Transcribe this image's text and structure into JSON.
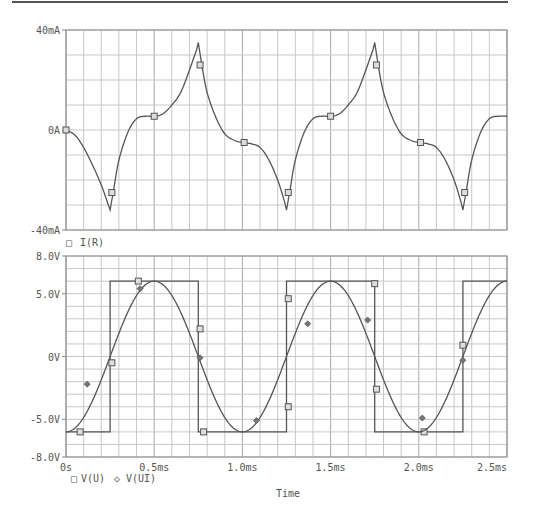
{
  "chart_data": [
    {
      "type": "line",
      "title": "",
      "xlabel": "",
      "ylabel": "",
      "xlim": [
        0,
        2.5
      ],
      "ylim": [
        -40,
        40
      ],
      "y_unit": "mA",
      "y_ticks": [
        {
          "value": 40,
          "label": "40mA"
        },
        {
          "value": 0,
          "label": "0A"
        },
        {
          "value": -40,
          "label": "-40mA"
        }
      ],
      "grid": true,
      "legend": [
        {
          "marker": "square",
          "label": "I(R)"
        }
      ],
      "series": [
        {
          "name": "I(R)",
          "marker": "square",
          "x": [
            0,
            0.05,
            0.1,
            0.15,
            0.2,
            0.24,
            0.25,
            0.27,
            0.3,
            0.35,
            0.4,
            0.45,
            0.5,
            0.55,
            0.6,
            0.65,
            0.7,
            0.74,
            0.75,
            0.77,
            0.8,
            0.85,
            0.9,
            0.95,
            1.0,
            1.05,
            1.1,
            1.15,
            1.2,
            1.24,
            1.25,
            1.27,
            1.3,
            1.35,
            1.4,
            1.45,
            1.5,
            1.55,
            1.6,
            1.65,
            1.7,
            1.74,
            1.75,
            1.77,
            1.8,
            1.85,
            1.9,
            1.95,
            2.0,
            2.05,
            2.1,
            2.15,
            2.2,
            2.24,
            2.25,
            2.27,
            2.3,
            2.35,
            2.4,
            2.45,
            2.5
          ],
          "y": [
            0,
            -2,
            -7,
            -14,
            -22,
            -30,
            -32,
            -24,
            -12,
            -1,
            4.5,
            5.5,
            5.5,
            6.5,
            10,
            15,
            24,
            32,
            35,
            26,
            15,
            5,
            -1.5,
            -4,
            -5,
            -5.5,
            -7,
            -12,
            -20,
            -29,
            -32,
            -24,
            -12,
            -1,
            4.5,
            5.5,
            5.5,
            6.5,
            10,
            15,
            24,
            32,
            35,
            26,
            15,
            5,
            -1.5,
            -4,
            -5,
            -5.5,
            -7,
            -12,
            -20,
            -29,
            -32,
            -24,
            -12,
            -1,
            4.5,
            5.5,
            5.5
          ],
          "marker_points": [
            [
              0,
              0
            ],
            [
              0.26,
              -25
            ],
            [
              0.5,
              5.5
            ],
            [
              0.76,
              26
            ],
            [
              1.01,
              -5
            ],
            [
              1.26,
              -25
            ],
            [
              1.5,
              5.5
            ],
            [
              1.76,
              26
            ],
            [
              2.01,
              -5
            ],
            [
              2.26,
              -25
            ]
          ]
        }
      ]
    },
    {
      "type": "line",
      "title": "",
      "xlabel": "Time",
      "ylabel": "",
      "xlim": [
        0,
        2.5
      ],
      "ylim": [
        -8,
        8
      ],
      "y_unit": "V",
      "x_ticks": [
        {
          "value": 0,
          "label": "0s"
        },
        {
          "value": 0.5,
          "label": "0.5ms"
        },
        {
          "value": 1.0,
          "label": "1.0ms"
        },
        {
          "value": 1.5,
          "label": "1.5ms"
        },
        {
          "value": 2.0,
          "label": "2.0ms"
        },
        {
          "value": 2.5,
          "label": "2.5ms"
        }
      ],
      "y_ticks": [
        {
          "value": 8,
          "label": "8.0V"
        },
        {
          "value": 5,
          "label": "5.0V"
        },
        {
          "value": 0,
          "label": "0V"
        },
        {
          "value": -5,
          "label": "-5.0V"
        },
        {
          "value": -8,
          "label": "-8.0V"
        }
      ],
      "grid": true,
      "legend": [
        {
          "marker": "square",
          "label": "V(U)"
        },
        {
          "marker": "diamond",
          "label": "V(UI)"
        }
      ],
      "series": [
        {
          "name": "V(U)",
          "marker": "square",
          "shape": "square-wave",
          "amplitude": 6,
          "x": [
            0,
            0.25,
            0.25,
            0.75,
            0.75,
            1.25,
            1.25,
            1.75,
            1.75,
            2.25,
            2.25,
            2.5
          ],
          "y": [
            -6,
            -6,
            6,
            6,
            -6,
            -6,
            6,
            6,
            -6,
            -6,
            6,
            6
          ],
          "marker_points": [
            [
              0.08,
              -6
            ],
            [
              0.26,
              -0.5
            ],
            [
              0.41,
              6
            ],
            [
              0.76,
              2.2
            ],
            [
              0.78,
              -6
            ],
            [
              1.26,
              -4
            ],
            [
              1.26,
              4.6
            ],
            [
              1.75,
              5.8
            ],
            [
              1.76,
              -2.6
            ],
            [
              2.03,
              -6
            ],
            [
              2.25,
              0.9
            ]
          ]
        },
        {
          "name": "V(UI)",
          "marker": "diamond",
          "shape": "sine",
          "amplitude": 6,
          "period_ms": 1.0,
          "phase_note": "minimum at 0, 1.0, 2.0ms; maximum at 0.5, 1.5, 2.5ms",
          "x": [
            0,
            0.1,
            0.2,
            0.25,
            0.3,
            0.4,
            0.5,
            0.6,
            0.7,
            0.75,
            0.8,
            0.9,
            1.0,
            1.1,
            1.2,
            1.25,
            1.3,
            1.4,
            1.5,
            1.6,
            1.7,
            1.75,
            1.8,
            1.9,
            2.0,
            2.1,
            2.2,
            2.25,
            2.3,
            2.4,
            2.5
          ],
          "y": [
            -6,
            -4.85,
            -1.85,
            0,
            1.85,
            4.85,
            6,
            4.85,
            1.85,
            0,
            -1.85,
            -4.85,
            -6,
            -4.85,
            -1.85,
            0,
            1.85,
            4.85,
            6,
            4.85,
            1.85,
            0,
            -1.85,
            -4.85,
            -6,
            -4.85,
            -1.85,
            0,
            1.85,
            4.85,
            6
          ],
          "marker_points": [
            [
              0.12,
              -2.2
            ],
            [
              0.42,
              5.4
            ],
            [
              0.76,
              -0.1
            ],
            [
              1.08,
              -5.1
            ],
            [
              1.37,
              2.6
            ],
            [
              1.71,
              2.9
            ],
            [
              2.02,
              -4.9
            ],
            [
              2.25,
              -0.3
            ]
          ]
        }
      ]
    }
  ],
  "legend_top": {
    "marker_glyph": "□",
    "label": "I(R)"
  },
  "legend_bottom": [
    {
      "marker_glyph": "□",
      "label": "V(U)"
    },
    {
      "marker_glyph": "◇",
      "label": "V(UI)"
    }
  ],
  "x_axis_title": "Time",
  "colors": {
    "trace": "#555555",
    "grid": "#c8c8c8",
    "grid_major": "#a8a8a8",
    "text": "#555555",
    "background": "#ffffff"
  }
}
